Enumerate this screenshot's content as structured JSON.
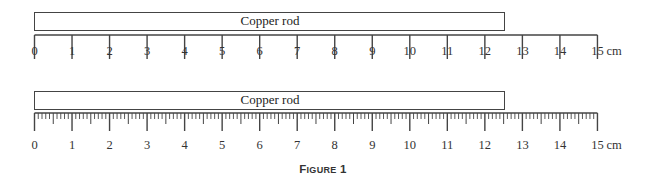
{
  "figure": {
    "caption_first": "F",
    "caption_rest": "IGURE",
    "caption_num": "1",
    "caption_full": "FIGURE 1"
  },
  "rulers": [
    {
      "name": "coarse-ruler",
      "rod_label": "Copper rod",
      "rod_length_cm": 12.5,
      "scale_min_cm": 0,
      "scale_max_cm": 15,
      "graduation": "1 cm",
      "unit": "cm",
      "labels": [
        "0",
        "1",
        "2",
        "3",
        "4",
        "5",
        "6",
        "7",
        "8",
        "9",
        "10",
        "11",
        "12",
        "13",
        "14",
        "15"
      ]
    },
    {
      "name": "fine-ruler",
      "rod_label": "Copper rod",
      "rod_length_cm": 12.5,
      "scale_min_cm": 0,
      "scale_max_cm": 15,
      "graduation": "1 mm",
      "unit": "cm",
      "labels": [
        "0",
        "1",
        "2",
        "3",
        "4",
        "5",
        "6",
        "7",
        "8",
        "9",
        "10",
        "11",
        "12",
        "13",
        "14",
        "15"
      ]
    }
  ],
  "colors": {
    "line": "#444444",
    "text": "#333333",
    "background": "#ffffff"
  }
}
